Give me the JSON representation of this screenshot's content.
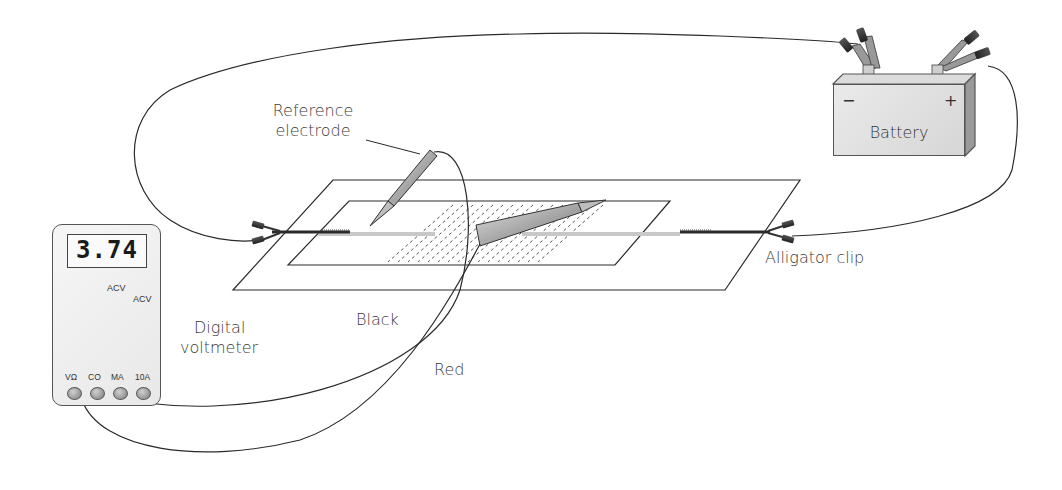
{
  "figure": {
    "type": "experimental apparatus diagram"
  },
  "labels": {
    "reference_electrode_line1": "Reference",
    "reference_electrode_line2": "electrode",
    "battery": "Battery",
    "battery_negative": "−",
    "battery_positive": "+",
    "alligator_clip": "Alligator clip",
    "digital_voltmeter_line1": "Digital",
    "digital_voltmeter_line2": "voltmeter",
    "black_lead": "Black",
    "red_lead": "Red"
  },
  "voltmeter": {
    "display_value": "3.74",
    "dial_labels": [
      "ACV",
      "ACV"
    ],
    "ports": [
      "VΩ",
      "CO",
      "MA",
      "10A"
    ]
  },
  "colors": {
    "line": "#2a2a2a",
    "text": "#3a3a3a",
    "device_fill": "#e6e6e6",
    "electrode_fill": "#bdbdbd",
    "field_line": "#c8c8c8"
  }
}
